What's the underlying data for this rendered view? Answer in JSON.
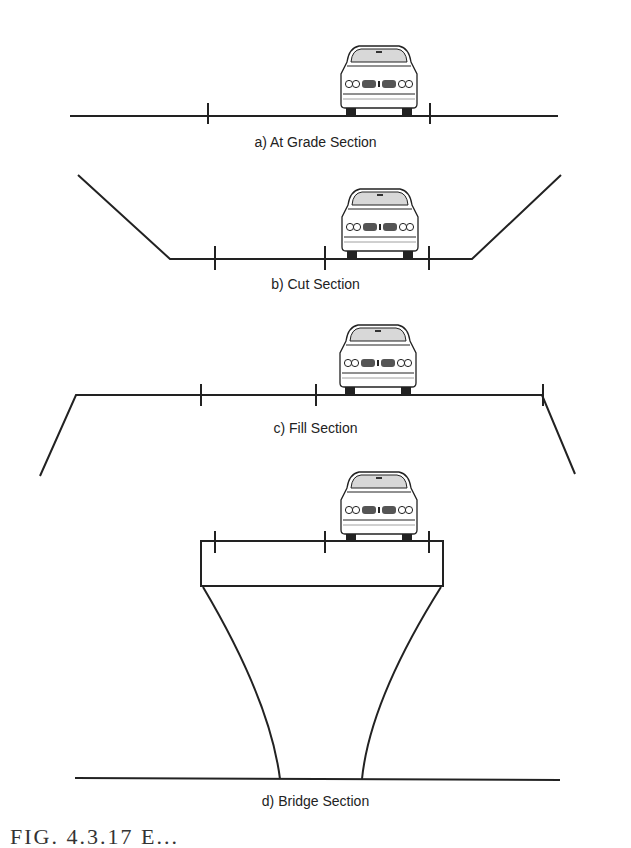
{
  "figure": {
    "panels": [
      {
        "id": "a",
        "label": "a) At Grade Section"
      },
      {
        "id": "b",
        "label": "b) Cut Section"
      },
      {
        "id": "c",
        "label": "c) Fill Section"
      },
      {
        "id": "d",
        "label": "d) Bridge Section"
      }
    ],
    "caption": "FIG. 4.3.17  E..."
  }
}
